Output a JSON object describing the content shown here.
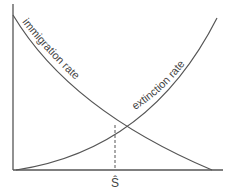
{
  "diagram": {
    "curves": [
      {
        "name": "immigration rate",
        "label": "immigration rate",
        "direction": "decreasing"
      },
      {
        "name": "extinction rate",
        "label": "extinction rate",
        "direction": "increasing"
      }
    ],
    "equilibrium": {
      "label": "Ŝ"
    },
    "axes": {
      "x_label": "",
      "y_label": ""
    },
    "colors": {
      "line": "#555555",
      "text": "#444444",
      "background": "#ffffff"
    }
  }
}
